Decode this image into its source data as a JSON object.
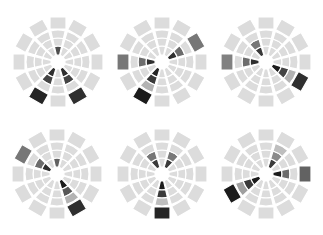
{
  "chart_data": {
    "type": "radial-heatmap-glyphs",
    "title": "",
    "spokes": 12,
    "rings": 4,
    "ring_radii": [
      7,
      16,
      24,
      32,
      45
    ],
    "base_color": "#dcdcdc",
    "dark_color": "#111111",
    "glyphs": [
      {
        "name": "glyph-1",
        "center": [
          58,
          62
        ],
        "highlights": [
          {
            "spoke": 0,
            "ring": 0,
            "value": 0.7
          },
          {
            "spoke": 5,
            "ring": 0,
            "value": 0.85
          },
          {
            "spoke": 5,
            "ring": 1,
            "value": 0.75
          },
          {
            "spoke": 5,
            "ring": 3,
            "value": 0.85
          },
          {
            "spoke": 7,
            "ring": 0,
            "value": 0.85
          },
          {
            "spoke": 7,
            "ring": 1,
            "value": 0.75
          },
          {
            "spoke": 7,
            "ring": 3,
            "value": 0.9
          }
        ]
      },
      {
        "name": "glyph-2",
        "center": [
          162,
          62
        ],
        "highlights": [
          {
            "spoke": 2,
            "ring": 0,
            "value": 0.85
          },
          {
            "spoke": 2,
            "ring": 1,
            "value": 0.55
          },
          {
            "spoke": 2,
            "ring": 3,
            "value": 0.5
          },
          {
            "spoke": 9,
            "ring": 0,
            "value": 0.85
          },
          {
            "spoke": 9,
            "ring": 1,
            "value": 0.55
          },
          {
            "spoke": 9,
            "ring": 3,
            "value": 0.5
          },
          {
            "spoke": 7,
            "ring": 0,
            "value": 0.9
          },
          {
            "spoke": 7,
            "ring": 1,
            "value": 0.8
          },
          {
            "spoke": 7,
            "ring": 2,
            "value": 0.2
          },
          {
            "spoke": 7,
            "ring": 3,
            "value": 0.95
          }
        ]
      },
      {
        "name": "glyph-3",
        "center": [
          266,
          62
        ],
        "highlights": [
          {
            "spoke": 11,
            "ring": 0,
            "value": 0.8
          },
          {
            "spoke": 11,
            "ring": 1,
            "value": 0.5
          },
          {
            "spoke": 9,
            "ring": 0,
            "value": 0.85
          },
          {
            "spoke": 9,
            "ring": 1,
            "value": 0.55
          },
          {
            "spoke": 9,
            "ring": 3,
            "value": 0.45
          },
          {
            "spoke": 4,
            "ring": 0,
            "value": 0.95
          },
          {
            "spoke": 4,
            "ring": 1,
            "value": 0.75
          },
          {
            "spoke": 4,
            "ring": 2,
            "value": 0.2
          },
          {
            "spoke": 4,
            "ring": 3,
            "value": 0.85
          }
        ]
      },
      {
        "name": "glyph-4",
        "center": [
          57,
          174
        ],
        "highlights": [
          {
            "spoke": 0,
            "ring": 0,
            "value": 0.6
          },
          {
            "spoke": 10,
            "ring": 0,
            "value": 0.85
          },
          {
            "spoke": 10,
            "ring": 1,
            "value": 0.55
          },
          {
            "spoke": 10,
            "ring": 3,
            "value": 0.5
          },
          {
            "spoke": 5,
            "ring": 0,
            "value": 0.95
          },
          {
            "spoke": 5,
            "ring": 1,
            "value": 0.65
          },
          {
            "spoke": 5,
            "ring": 2,
            "value": 0.2
          },
          {
            "spoke": 5,
            "ring": 3,
            "value": 0.85
          }
        ]
      },
      {
        "name": "glyph-5",
        "center": [
          162,
          174
        ],
        "highlights": [
          {
            "spoke": 11,
            "ring": 0,
            "value": 0.8
          },
          {
            "spoke": 11,
            "ring": 1,
            "value": 0.5
          },
          {
            "spoke": 1,
            "ring": 0,
            "value": 0.8
          },
          {
            "spoke": 1,
            "ring": 1,
            "value": 0.5
          },
          {
            "spoke": 6,
            "ring": 0,
            "value": 0.95
          },
          {
            "spoke": 6,
            "ring": 1,
            "value": 0.8
          },
          {
            "spoke": 6,
            "ring": 2,
            "value": 0.15
          },
          {
            "spoke": 6,
            "ring": 3,
            "value": 0.9
          }
        ]
      },
      {
        "name": "glyph-6",
        "center": [
          266,
          174
        ],
        "highlights": [
          {
            "spoke": 1,
            "ring": 0,
            "value": 0.8
          },
          {
            "spoke": 1,
            "ring": 1,
            "value": 0.4
          },
          {
            "spoke": 1,
            "ring": 2,
            "value": 0.15
          },
          {
            "spoke": 3,
            "ring": 0,
            "value": 0.95
          },
          {
            "spoke": 3,
            "ring": 1,
            "value": 0.55
          },
          {
            "spoke": 3,
            "ring": 3,
            "value": 0.6
          },
          {
            "spoke": 8,
            "ring": 0,
            "value": 0.95
          },
          {
            "spoke": 8,
            "ring": 1,
            "value": 0.8
          },
          {
            "spoke": 8,
            "ring": 2,
            "value": 0.3
          },
          {
            "spoke": 8,
            "ring": 3,
            "value": 0.95
          }
        ]
      }
    ]
  }
}
